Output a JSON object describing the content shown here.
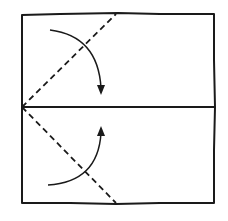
{
  "diagram": {
    "type": "origami-fold-instruction",
    "paper": {
      "shape": "square",
      "x": 22,
      "y": 14,
      "width": 192,
      "height": 189,
      "stroke_color": "#1a1a1a"
    },
    "crease_lines": [
      {
        "name": "center-horizontal-crease",
        "style": "solid",
        "from": [
          22,
          107
        ],
        "to": [
          214,
          107
        ]
      }
    ],
    "fold_lines": [
      {
        "name": "top-valley-fold-line",
        "style": "dashed",
        "from": [
          22,
          107
        ],
        "to": [
          116,
          14
        ]
      },
      {
        "name": "bottom-valley-fold-line",
        "style": "dashed",
        "from": [
          22,
          107
        ],
        "to": [
          116,
          203
        ]
      }
    ],
    "arrows": [
      {
        "name": "fold-down-arrow",
        "direction": "down",
        "start": [
          50,
          30
        ],
        "tip": [
          101,
          94
        ]
      },
      {
        "name": "fold-up-arrow",
        "direction": "up",
        "start": [
          48,
          185
        ],
        "tip": [
          101,
          127
        ]
      }
    ],
    "colors": {
      "ink": "#1a1a1a",
      "paper": "#ffffff"
    }
  }
}
